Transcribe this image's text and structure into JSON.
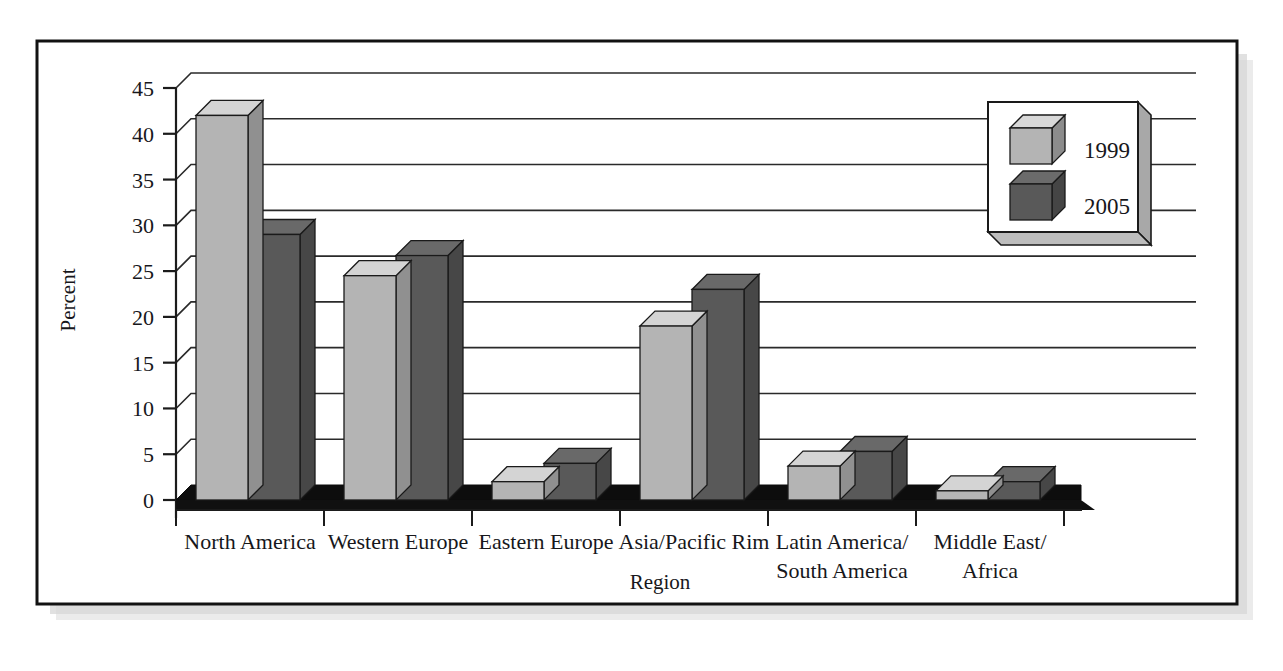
{
  "figure": {
    "frame_border_color": "#111111",
    "shadow_color": "#b9b9b9",
    "background": "#ffffff"
  },
  "chart_data": {
    "type": "bar",
    "title": "",
    "subtitle": "",
    "xlabel": "Region",
    "ylabel": "Percent",
    "categories": [
      "North America",
      "Western Europe",
      "Eastern Europe",
      "Asia/Pacific Rim",
      "Latin America/\nSouth America",
      "Middle East/\nAfrica"
    ],
    "category_lines": [
      [
        "North America"
      ],
      [
        "Western Europe"
      ],
      [
        "Eastern Europe"
      ],
      [
        "Asia/Pacific Rim"
      ],
      [
        "Latin America/",
        "South America"
      ],
      [
        "Middle East/",
        "Africa"
      ]
    ],
    "series": [
      {
        "name": "1999",
        "color": "#b4b4b4",
        "values": [
          42,
          24.5,
          2,
          19,
          3.7,
          1
        ]
      },
      {
        "name": "2005",
        "color": "#595959",
        "values": [
          29,
          26.7,
          4,
          23,
          5.3,
          2
        ]
      }
    ],
    "ylim": [
      0,
      45
    ],
    "yticks": [
      0,
      5,
      10,
      15,
      20,
      25,
      30,
      35,
      40,
      45
    ],
    "ytick_labels": [
      "0",
      "5",
      "10",
      "15",
      "20",
      "25",
      "30",
      "35",
      "40",
      "45"
    ],
    "grid": true,
    "grid_axis": "y",
    "legend_position": "top-right",
    "legend_entries": [
      "1999",
      "2005"
    ],
    "style": "3d-bars"
  }
}
